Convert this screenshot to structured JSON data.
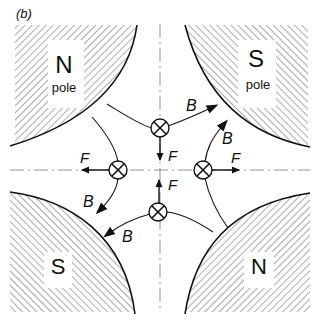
{
  "figure": {
    "panel_label": "(b)",
    "poles": [
      {
        "id": "top-left",
        "letter": "N",
        "sub": "pole"
      },
      {
        "id": "top-right",
        "letter": "S",
        "sub": "pole"
      },
      {
        "id": "bottom-left",
        "letter": "S",
        "sub": ""
      },
      {
        "id": "bottom-right",
        "letter": "N",
        "sub": ""
      }
    ],
    "conductors": [
      {
        "id": "top",
        "symbol": "current-into-page",
        "force_label": "F",
        "force_dir": "down"
      },
      {
        "id": "left",
        "symbol": "current-into-page",
        "force_label": "F",
        "force_dir": "left"
      },
      {
        "id": "right",
        "symbol": "current-into-page",
        "force_label": "F",
        "force_dir": "right"
      },
      {
        "id": "bottom",
        "symbol": "current-into-page",
        "force_label": "F",
        "force_dir": "up"
      }
    ],
    "field_labels": [
      "B",
      "B",
      "B",
      "B"
    ],
    "colors": {
      "ink": "#111111",
      "hatch": "#555555",
      "background": "#ffffff"
    }
  }
}
